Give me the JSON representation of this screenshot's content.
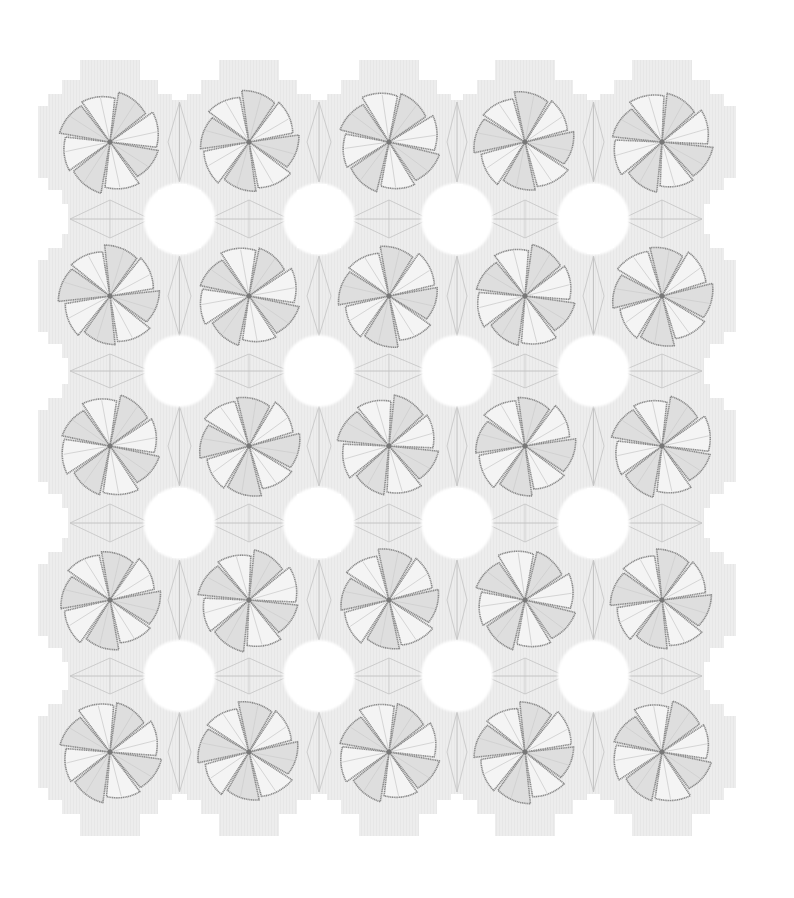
{
  "image": {
    "subject": "origami tessellation of pinwheel flowers",
    "width": 794,
    "height": 898,
    "background": "#ffffff",
    "paper_color": "#ececec",
    "paper_shade": "#dcdcdc",
    "crease_color": "#c4c4c4",
    "petal_fill": "#f4f4f4",
    "petal_shade": "#dedede",
    "outline_color": "#8a8a8a"
  },
  "grid": {
    "rows": 5,
    "cols": 5,
    "col_centers": [
      110,
      249,
      389,
      525,
      662
    ],
    "row_centers": [
      142,
      296,
      446,
      600,
      752
    ],
    "flower_radius": 52,
    "petals": 8,
    "rotations": [
      [
        10,
        -8,
        14,
        -12,
        6
      ],
      [
        -6,
        12,
        -10,
        8,
        -14
      ],
      [
        12,
        -14,
        6,
        -8,
        10
      ],
      [
        -10,
        6,
        -12,
        14,
        -6
      ],
      [
        8,
        -12,
        10,
        -6,
        12
      ]
    ]
  }
}
